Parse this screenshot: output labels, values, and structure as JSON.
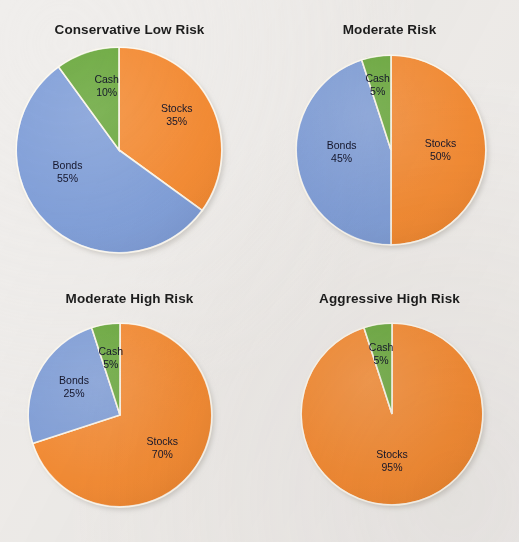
{
  "page": {
    "background_color": "#f0eeec",
    "title_color": "#1d1d1d",
    "label_color": "#15162b"
  },
  "palette": {
    "stocks": "#f4892f",
    "bonds": "#7e9dd8",
    "cash": "#67a739",
    "slice_edge": "#fbf6ea",
    "shadow": "#c9c6c2"
  },
  "chart_data": [
    {
      "type": "pie",
      "title": "Conservative Low Risk",
      "categories": [
        "Stocks",
        "Bonds",
        "Cash"
      ],
      "values": [
        35,
        55,
        10
      ],
      "colors": [
        "#f4892f",
        "#7e9dd8",
        "#67a739"
      ],
      "labels": [
        {
          "name": "Stocks",
          "pct": "35%"
        },
        {
          "name": "Bonds",
          "pct": "55%"
        },
        {
          "name": "Cash",
          "pct": "10%"
        }
      ],
      "start_angle": 0,
      "legend": "inside-slices",
      "cx": 119,
      "cy": 150,
      "r": 103
    },
    {
      "type": "pie",
      "title": "Moderate Risk",
      "categories": [
        "Stocks",
        "Bonds",
        "Cash"
      ],
      "values": [
        50,
        45,
        5
      ],
      "colors": [
        "#f4892f",
        "#7e9dd8",
        "#67a739"
      ],
      "labels": [
        {
          "name": "Stocks",
          "pct": "50%"
        },
        {
          "name": "Bonds",
          "pct": "45%"
        },
        {
          "name": "Cash",
          "pct": "5%"
        }
      ],
      "start_angle": 0,
      "legend": "inside-slices",
      "cx": 391,
      "cy": 150,
      "r": 95
    },
    {
      "type": "pie",
      "title": "Moderate High Risk",
      "categories": [
        "Stocks",
        "Bonds",
        "Cash"
      ],
      "values": [
        70,
        25,
        5
      ],
      "colors": [
        "#f4892f",
        "#7e9dd8",
        "#67a739"
      ],
      "labels": [
        {
          "name": "Stocks",
          "pct": "70%"
        },
        {
          "name": "Bonds",
          "pct": "25%"
        },
        {
          "name": "Cash",
          "pct": "5%"
        }
      ],
      "start_angle": 0,
      "legend": "inside-slices",
      "cx": 120,
      "cy": 415,
      "r": 92
    },
    {
      "type": "pie",
      "title": "Aggressive High Risk",
      "categories": [
        "Stocks",
        "Cash"
      ],
      "values": [
        95,
        5
      ],
      "colors": [
        "#f4892f",
        "#67a739"
      ],
      "labels": [
        {
          "name": "Stocks",
          "pct": "95%"
        },
        {
          "name": "Cash",
          "pct": "5%"
        }
      ],
      "start_angle": 0,
      "legend": "inside-slices",
      "cx": 392,
      "cy": 414,
      "r": 91
    }
  ],
  "label_overrides": {
    "0": {
      "Stocks": [
        0.56,
        -0.34
      ],
      "Bonds": [
        -0.5,
        0.22
      ],
      "Cash": [
        -0.12,
        -0.62
      ]
    },
    "1": {
      "Stocks": [
        0.52,
        0.0
      ],
      "Bonds": [
        -0.52,
        0.02
      ],
      "Cash": [
        -0.14,
        -0.68
      ]
    },
    "2": {
      "Stocks": [
        0.46,
        0.36
      ],
      "Bonds": [
        -0.5,
        -0.3
      ],
      "Cash": [
        -0.1,
        -0.62
      ]
    },
    "3": {
      "Stocks": [
        0.0,
        0.52
      ],
      "Cash": [
        -0.12,
        -0.66
      ]
    }
  }
}
